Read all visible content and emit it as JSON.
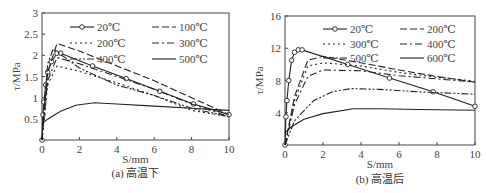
{
  "chart_data": [
    {
      "type": "line",
      "title": "",
      "caption": "(a) 高温下",
      "xlabel": "S/mm",
      "ylabel": "τ/MPa",
      "xlim": [
        0,
        10
      ],
      "ylim": [
        0,
        3
      ],
      "xticks": [
        "0",
        "2",
        "4",
        "6",
        "8",
        "10"
      ],
      "yticks": [
        "0.5",
        "1",
        "1.5",
        "2",
        "2.5",
        "3"
      ],
      "legend_position": "upper-right inside",
      "series": [
        {
          "name": "20℃",
          "style": "solid-circle",
          "x": [
            0,
            0.05,
            0.1,
            0.2,
            0.3,
            0.5,
            0.8,
            1,
            2.7,
            4.5,
            6.3,
            8.1,
            10
          ],
          "y": [
            0,
            0.6,
            0.9,
            1.3,
            1.6,
            1.85,
            2.05,
            2.05,
            1.75,
            1.45,
            1.15,
            0.85,
            0.6
          ]
        },
        {
          "name": "100℃",
          "style": "dashed",
          "x": [
            0,
            0.3,
            0.8,
            2,
            4,
            6,
            8,
            10
          ],
          "y": [
            0,
            1.6,
            2.28,
            2.1,
            1.75,
            1.4,
            1.0,
            0.6
          ]
        },
        {
          "name": "200℃",
          "style": "dotted",
          "x": [
            0,
            0.3,
            0.8,
            2,
            4,
            6,
            8,
            10
          ],
          "y": [
            0,
            1.3,
            1.75,
            1.62,
            1.35,
            1.05,
            0.7,
            0.55
          ]
        },
        {
          "name": "300℃",
          "style": "dash-dot",
          "x": [
            0,
            0.3,
            0.8,
            2,
            4,
            6,
            8,
            10
          ],
          "y": [
            0,
            1.4,
            1.95,
            1.8,
            1.5,
            1.2,
            0.85,
            0.55
          ]
        },
        {
          "name": "400℃",
          "style": "dash-dot-dot",
          "x": [
            0,
            0.3,
            0.6,
            2,
            4,
            6,
            8,
            10
          ],
          "y": [
            0,
            1.8,
            2.15,
            1.7,
            1.3,
            1.05,
            0.75,
            0.55
          ]
        },
        {
          "name": "500℃",
          "style": "solid",
          "x": [
            0,
            0.5,
            1,
            1.8,
            2.8,
            4,
            6,
            8,
            10
          ],
          "y": [
            0.4,
            0.55,
            0.68,
            0.82,
            0.88,
            0.85,
            0.8,
            0.75,
            0.7
          ]
        }
      ]
    },
    {
      "type": "line",
      "title": "",
      "caption": "(b) 高温后",
      "xlabel": "S/mm",
      "ylabel": "τ/MPa",
      "xlim": [
        0,
        10
      ],
      "ylim": [
        0,
        16
      ],
      "xticks": [
        "0",
        "2",
        "4",
        "6",
        "8",
        "10"
      ],
      "yticks": [
        "4",
        "8",
        "12",
        "16"
      ],
      "legend_position": "upper-right inside",
      "series": [
        {
          "name": "20℃",
          "style": "solid-circle",
          "x": [
            0,
            0.05,
            0.1,
            0.2,
            0.35,
            0.5,
            0.7,
            0.9,
            3.3,
            5.5,
            7.8,
            10
          ],
          "y": [
            0,
            3.5,
            5.5,
            8,
            10.5,
            11.5,
            11.8,
            11.8,
            10,
            8.3,
            6.6,
            4.8
          ]
        },
        {
          "name": "200℃",
          "style": "dashed",
          "x": [
            0,
            0.5,
            1.2,
            2,
            4,
            6,
            8,
            10
          ],
          "y": [
            0,
            6,
            10.5,
            11,
            10.2,
            9.3,
            8.5,
            7.8
          ]
        },
        {
          "name": "300℃",
          "style": "dotted",
          "x": [
            0,
            0.5,
            1.2,
            2,
            4,
            6,
            8,
            10
          ],
          "y": [
            0,
            5.5,
            9.8,
            10.2,
            9.8,
            9.0,
            8.4,
            7.9
          ]
        },
        {
          "name": "400℃",
          "style": "dash-dot",
          "x": [
            0,
            0.5,
            1.2,
            2,
            4,
            6,
            8,
            10
          ],
          "y": [
            0,
            5,
            8.5,
            9.3,
            9.2,
            8.6,
            8.2,
            7.8
          ]
        },
        {
          "name": "500℃",
          "style": "dash-dot-dot",
          "x": [
            0,
            0.5,
            1.5,
            2.5,
            3.5,
            5,
            7,
            10
          ],
          "y": [
            0,
            3,
            5.5,
            6.6,
            7,
            6.9,
            6.6,
            6.3
          ]
        },
        {
          "name": "600℃",
          "style": "solid",
          "x": [
            0,
            0.3,
            1,
            2,
            3.6,
            5,
            7,
            10
          ],
          "y": [
            1.5,
            2.2,
            3.2,
            3.9,
            4.5,
            4.5,
            4.4,
            4.3
          ]
        }
      ]
    }
  ],
  "figure": {
    "left_caption": "(a) 高温下",
    "right_caption": "(b) 高温后",
    "xlabel": "S/mm",
    "ylabel": "τ/MPa"
  }
}
